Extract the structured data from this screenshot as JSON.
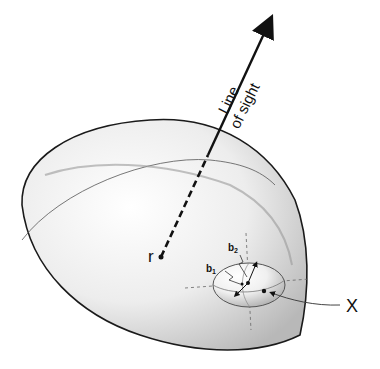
{
  "diagram": {
    "type": "3d-ellipsoid-schematic",
    "labels": {
      "line_of_sight_line1": "Line",
      "line_of_sight_line2": "of sight",
      "center": "r",
      "point_x": "X",
      "b1": "b",
      "b1_sub": "1",
      "b2": "b",
      "b2_sub": "2"
    },
    "elements": [
      {
        "id": "large-ellipsoid",
        "description": "Large translucent gray ellipsoid (halo)"
      },
      {
        "id": "small-ellipsoid",
        "description": "Small sub-ellipsoid (subhalo) near lower right of large ellipsoid"
      },
      {
        "id": "line-of-sight-arrow",
        "description": "Arrow from center r outward; dashed inside ellipsoid, solid outside"
      },
      {
        "id": "axes-b1-b2",
        "description": "Arrows from subhalo center indicating semi-axes b1 and b2"
      },
      {
        "id": "pointer-x",
        "description": "Curved line pointing to point X on subhalo surface"
      }
    ],
    "colors": {
      "outline": "#1a1a1a",
      "fill_light": "#f7f7f7",
      "fill_dark": "#bdbdbd",
      "guide_line": "#555555"
    }
  }
}
